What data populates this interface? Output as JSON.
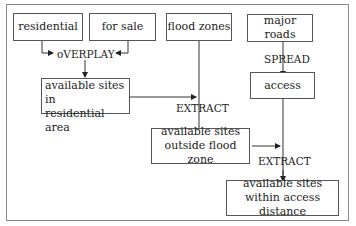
{
  "diagram": {
    "inputs": {
      "residential": "residential",
      "for_sale": "for sale",
      "flood_zones": "flood zones",
      "major_roads": "major roads"
    },
    "operations": {
      "overlay": "oVERPLAY",
      "spread": "SPREAD",
      "extract1": "EXTRACT",
      "extract2": "EXTRACT"
    },
    "intermediate": {
      "access": "access",
      "residential_sites_line1": "available sites in",
      "residential_sites_line2": "residential area",
      "outside_flood_line1": "available sites",
      "outside_flood_line2": "outside flood zone"
    },
    "output": {
      "line1": "available sites",
      "line2": "within access distance"
    },
    "colors": {
      "line": "#333333",
      "border": "#555555",
      "frame": "#888888"
    }
  }
}
